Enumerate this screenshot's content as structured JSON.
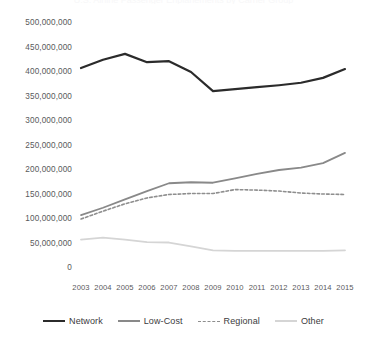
{
  "chart_data": {
    "type": "line",
    "title": "U.S. Airline Passenger Enplanements by Carrier Group",
    "xlabel": "",
    "ylabel": "",
    "x": [
      2003,
      2004,
      2005,
      2006,
      2007,
      2008,
      2009,
      2010,
      2011,
      2012,
      2013,
      2014,
      2015
    ],
    "categories": [
      "2003",
      "2004",
      "2005",
      "2006",
      "2007",
      "2008",
      "2009",
      "2010",
      "2011",
      "2012",
      "2013",
      "2014",
      "2015"
    ],
    "ylim": [
      0,
      500000000
    ],
    "ytick_values": [
      0,
      50000000,
      100000000,
      150000000,
      200000000,
      250000000,
      300000000,
      350000000,
      400000000,
      450000000,
      500000000
    ],
    "ytick_labels": [
      "0",
      "50,000,000",
      "100,000,000",
      "150,000,000",
      "200,000,000",
      "250,000,000",
      "300,000,000",
      "350,000,000",
      "400,000,000",
      "450,000,000",
      "500,000,000"
    ],
    "grid": false,
    "legend_position": "bottom",
    "series": [
      {
        "name": "Network",
        "color": "#2b2b2b",
        "width": 2.2,
        "dash": "none",
        "values": [
          408000000,
          425000000,
          437000000,
          420000000,
          422000000,
          400000000,
          361000000,
          365000000,
          369000000,
          373000000,
          378000000,
          388000000,
          406000000
        ]
      },
      {
        "name": "Low-Cost",
        "color": "#898989",
        "width": 1.8,
        "dash": "none",
        "values": [
          108000000,
          123000000,
          140000000,
          157000000,
          173000000,
          175000000,
          174000000,
          183000000,
          192000000,
          200000000,
          205000000,
          214000000,
          235000000
        ]
      },
      {
        "name": "Regional",
        "color": "#8e8e8e",
        "width": 1.6,
        "dash": "dashed",
        "values": [
          100000000,
          116000000,
          131000000,
          143000000,
          150000000,
          152000000,
          152000000,
          160000000,
          159000000,
          157000000,
          153000000,
          151000000,
          150000000
        ]
      },
      {
        "name": "Other",
        "color": "#d5d5d5",
        "width": 1.8,
        "dash": "none",
        "values": [
          58000000,
          62000000,
          58000000,
          53000000,
          52000000,
          44000000,
          36000000,
          35000000,
          35000000,
          35000000,
          35000000,
          35000000,
          36000000
        ]
      }
    ]
  },
  "legend": {
    "items": [
      {
        "label": "Network"
      },
      {
        "label": "Low-Cost"
      },
      {
        "label": "Regional"
      },
      {
        "label": "Other"
      }
    ]
  }
}
